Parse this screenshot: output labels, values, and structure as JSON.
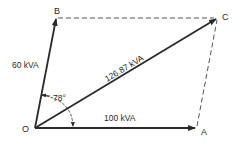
{
  "diagram": {
    "type": "phasor-parallelogram",
    "colors": {
      "line": "#2a2a2a",
      "dashed": "#555555",
      "background": "#ffffff"
    },
    "points": {
      "O": {
        "label": "O",
        "x": 35,
        "y": 128
      },
      "A": {
        "label": "A",
        "x": 196,
        "y": 128
      },
      "B": {
        "label": "B",
        "x": 56,
        "y": 18
      },
      "C": {
        "label": "C",
        "x": 217,
        "y": 18
      }
    },
    "vectors": [
      {
        "from": "O",
        "to": "A",
        "label": "100 kVA"
      },
      {
        "from": "O",
        "to": "B",
        "label": "60 kVA"
      },
      {
        "from": "O",
        "to": "C",
        "label": "126.87 kVA"
      }
    ],
    "dashed_lines": [
      {
        "from": "B",
        "to": "C"
      },
      {
        "from": "A",
        "to": "C"
      }
    ],
    "angle": {
      "label": "78°",
      "between": [
        "OB",
        "OA"
      ]
    }
  }
}
